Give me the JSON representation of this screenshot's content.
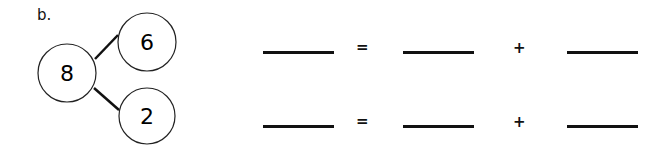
{
  "problem": {
    "label": "b.",
    "number_bond": {
      "whole": "8",
      "parts": [
        "6",
        "2"
      ]
    },
    "equations": [
      {
        "blanks": [
          "",
          "",
          ""
        ],
        "equals": "=",
        "plus": "+"
      },
      {
        "blanks": [
          "",
          "",
          ""
        ],
        "equals": "=",
        "plus": "+"
      }
    ]
  }
}
